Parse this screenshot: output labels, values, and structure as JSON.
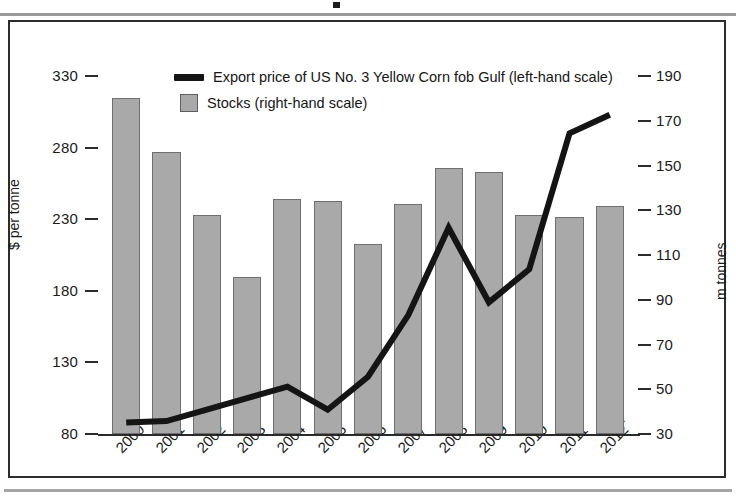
{
  "figure": {
    "frame_border_color": "#2c2c2c",
    "background": "#ffffff"
  },
  "legend": {
    "items": [
      {
        "marker": "line",
        "label": "Export price of US No. 3 Yellow Corn fob Gulf (left-hand scale)",
        "color": "#141414"
      },
      {
        "marker": "box",
        "label": "Stocks (right-hand scale)",
        "color": "#a9a9a9"
      }
    ]
  },
  "axes": {
    "left_title": "$ per tonne",
    "right_title": "m tonnes",
    "left_ticks": [
      "330",
      "280",
      "230",
      "180",
      "130",
      "80"
    ],
    "right_ticks": [
      "190",
      "170",
      "150",
      "130",
      "110",
      "90",
      "70",
      "50",
      "30"
    ]
  },
  "chart_data": {
    "type": "bar",
    "title": "",
    "subtitle": "",
    "xlabel": "",
    "ylabel": "$ per tonne",
    "y2label": "m tonnes",
    "grid": false,
    "legend_position": "top-center",
    "categories": [
      "2000",
      "2001",
      "2002",
      "2003",
      "2004",
      "2005",
      "2006",
      "2007",
      "2008",
      "2009",
      "2010",
      "2011",
      "2012*"
    ],
    "category_labels_display": [
      "2000",
      "2001",
      "2002",
      "2003",
      "2004",
      "2005",
      "2006",
      "2007",
      "2008",
      "2009",
      "2010",
      "2011",
      "2012"
    ],
    "last_category_footnote_marker": "*",
    "ylim": [
      80,
      330
    ],
    "ytick_values": [
      80,
      130,
      180,
      230,
      280,
      330
    ],
    "y2lim": [
      30,
      190
    ],
    "y2tick_values": [
      30,
      50,
      70,
      90,
      110,
      130,
      150,
      170,
      190
    ],
    "series": [
      {
        "name": "Stocks (right-hand scale)",
        "type": "bar",
        "axis": "right",
        "unit": "m tonnes",
        "color": "#a9a9a9",
        "edge_color": "#6f6f6f",
        "values": [
          180,
          156,
          128,
          100,
          135,
          134,
          115,
          133,
          149,
          147,
          128,
          127,
          132
        ]
      },
      {
        "name": "Export price of US No. 3 Yellow Corn fob Gulf (left-hand scale)",
        "type": "line",
        "axis": "left",
        "unit": "$ per tonne",
        "color": "#141414",
        "line_width": 6,
        "values": [
          88,
          89,
          97,
          105,
          113,
          97,
          120,
          163,
          224,
          172,
          195,
          290,
          303
        ]
      }
    ]
  }
}
